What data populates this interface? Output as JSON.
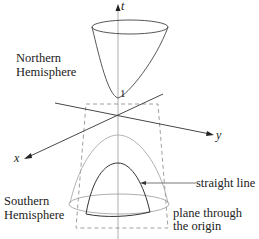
{
  "diagram": {
    "type": "hyperboloid of two sheets with light cone",
    "axes": {
      "t": "t",
      "x": "x",
      "y": "y"
    },
    "vertex_label": "1",
    "labels": {
      "northern_1": "Northern",
      "northern_2": "Hemisphere",
      "southern_1": "Southern",
      "southern_2": "Hemisphere",
      "straight_line": "straight line",
      "plane_1": "plane through",
      "plane_2": "the origin"
    },
    "colors": {
      "ink": "#333333",
      "light": "#aaaaaa",
      "dash": "#777777"
    }
  }
}
